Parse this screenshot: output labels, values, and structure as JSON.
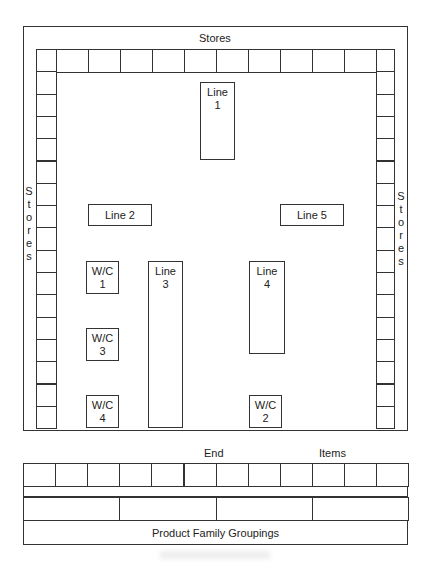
{
  "diagram": {
    "type": "factory-layout",
    "stores_top_label": "Stores",
    "stores_left_label": [
      "S",
      "t",
      "o",
      "r",
      "e",
      "s"
    ],
    "stores_right_label": [
      "S",
      "t",
      "o",
      "r",
      "e",
      "s"
    ],
    "top_store_cells": 11,
    "left_store_cells": 17,
    "right_store_cells": 17,
    "lines": [
      {
        "id": "line1",
        "label": "Line\n1",
        "l1": "Line",
        "l2": "1"
      },
      {
        "id": "line2",
        "label": "Line 2"
      },
      {
        "id": "line3",
        "l1": "Line",
        "l2": "3"
      },
      {
        "id": "line4",
        "l1": "Line",
        "l2": "4"
      },
      {
        "id": "line5",
        "label": "Line 5"
      }
    ],
    "work_centers": [
      {
        "id": "wc1",
        "l1": "W/C",
        "l2": "1"
      },
      {
        "id": "wc2",
        "l1": "W/C",
        "l2": "2"
      },
      {
        "id": "wc3",
        "l1": "W/C",
        "l2": "3"
      },
      {
        "id": "wc4",
        "l1": "W/C",
        "l2": "4"
      }
    ],
    "end_items": {
      "label_end": "End",
      "label_items": "Items",
      "end_item_cells": 12,
      "family_group_cells": 4,
      "groupings_label": "Product Family Groupings"
    }
  }
}
